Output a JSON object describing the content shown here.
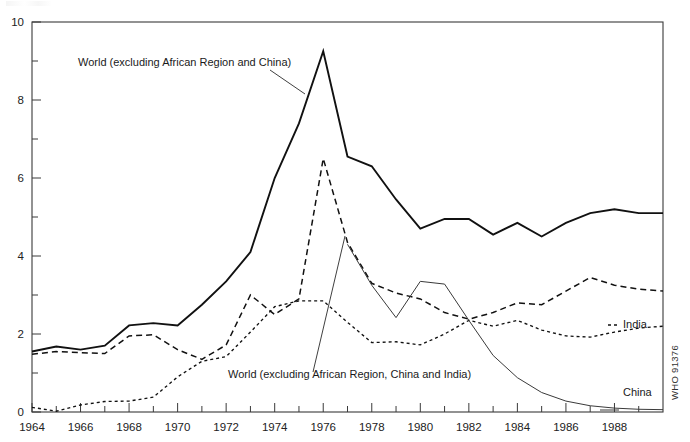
{
  "figure": {
    "credit": "WHO 91376",
    "background": "#ffffff",
    "ink_color": "#111111"
  },
  "annotations": [
    {
      "name": "annotation-world-excl-africa-china",
      "text": "World (excluding African Region and China)",
      "x": 78,
      "y": 66,
      "leader": "M 270 70 L 305 94"
    },
    {
      "name": "annotation-world-excl-africa-china-india",
      "text": "World (excluding African Region, China and India)",
      "x": 228,
      "y": 378,
      "leader": "M 345 236 L 313 372"
    }
  ],
  "series_labels": [
    {
      "name": "series-label-india",
      "text": "India",
      "x": 623,
      "y": 328
    },
    {
      "name": "series-label-china",
      "text": "China",
      "x": 623,
      "y": 396
    }
  ],
  "chart_data": {
    "type": "line",
    "title": "",
    "subtitle": "",
    "xlabel": "",
    "ylabel": "",
    "xlim": [
      1964,
      1990
    ],
    "ylim": [
      0,
      10
    ],
    "yticks": [
      0,
      2,
      4,
      6,
      8,
      10
    ],
    "ytick_labels": [
      "0",
      "2",
      "4",
      "6",
      "8",
      "10"
    ],
    "yminor_ticks": [
      1,
      3,
      5,
      7,
      9
    ],
    "xticks": [
      1964,
      1966,
      1968,
      1970,
      1972,
      1974,
      1976,
      1978,
      1980,
      1982,
      1984,
      1986,
      1988
    ],
    "xtick_labels": [
      "1964",
      "1966",
      "1968",
      "1970",
      "1972",
      "1974",
      "1976",
      "1978",
      "1980",
      "1982",
      "1984",
      "1986",
      "1988"
    ],
    "xminor_ticks": [
      1965,
      1967,
      1969,
      1971,
      1973,
      1975,
      1977,
      1979,
      1981,
      1983,
      1985,
      1987,
      1989
    ],
    "grid": false,
    "legend_position": "inline-annotations",
    "series": [
      {
        "name": "World (excluding African Region and China)",
        "style": "solid-thick",
        "x": [
          1964,
          1965,
          1966,
          1967,
          1968,
          1969,
          1970,
          1971,
          1972,
          1973,
          1974,
          1975,
          1976,
          1977,
          1978,
          1979,
          1980,
          1981,
          1982,
          1983,
          1984,
          1985,
          1986,
          1987,
          1988,
          1989,
          1990
        ],
        "values": [
          1.55,
          1.68,
          1.6,
          1.7,
          2.22,
          2.28,
          2.22,
          2.75,
          3.35,
          4.1,
          6.0,
          7.4,
          9.25,
          6.55,
          6.3,
          5.45,
          4.7,
          4.95,
          4.95,
          4.55,
          4.85,
          4.5,
          4.85,
          5.1,
          5.2,
          5.1,
          5.1
        ]
      },
      {
        "name": "World (excluding African Region, China and India)",
        "style": "dashed",
        "x": [
          1964,
          1965,
          1966,
          1967,
          1968,
          1969,
          1970,
          1971,
          1972,
          1973,
          1974,
          1975,
          1976,
          1977,
          1978,
          1979,
          1980,
          1981,
          1982,
          1983,
          1984,
          1985,
          1986,
          1987,
          1988,
          1989,
          1990
        ],
        "values": [
          1.48,
          1.55,
          1.52,
          1.5,
          1.95,
          1.98,
          1.6,
          1.35,
          1.72,
          3.0,
          2.5,
          2.9,
          6.5,
          4.35,
          3.3,
          3.05,
          2.9,
          2.55,
          2.38,
          2.55,
          2.8,
          2.75,
          3.1,
          3.45,
          3.25,
          3.15,
          3.1
        ]
      },
      {
        "name": "India",
        "style": "dotted",
        "x": [
          1964,
          1965,
          1966,
          1967,
          1968,
          1969,
          1970,
          1971,
          1972,
          1973,
          1974,
          1975,
          1976,
          1977,
          1978,
          1979,
          1980,
          1981,
          1982,
          1983,
          1984,
          1985,
          1986,
          1987,
          1988,
          1989,
          1990
        ],
        "values": [
          0.12,
          0.02,
          0.18,
          0.27,
          0.28,
          0.38,
          0.9,
          1.3,
          1.42,
          2.05,
          2.7,
          2.85,
          2.85,
          2.3,
          1.78,
          1.8,
          1.72,
          2.0,
          2.35,
          2.2,
          2.35,
          2.1,
          1.95,
          1.92,
          2.05,
          2.15,
          2.2
        ]
      },
      {
        "name": "China",
        "style": "thin-solid",
        "x": [
          1977,
          1978,
          1979,
          1980,
          1981,
          1982,
          1983,
          1984,
          1985,
          1986,
          1987,
          1988,
          1989,
          1990
        ],
        "values": [
          4.3,
          3.25,
          2.42,
          3.35,
          3.28,
          2.35,
          1.45,
          0.88,
          0.5,
          0.28,
          0.16,
          0.1,
          0.07,
          0.06
        ]
      }
    ]
  },
  "plot_geometry": {
    "left": 32,
    "right": 663,
    "top": 22,
    "bottom": 412
  }
}
